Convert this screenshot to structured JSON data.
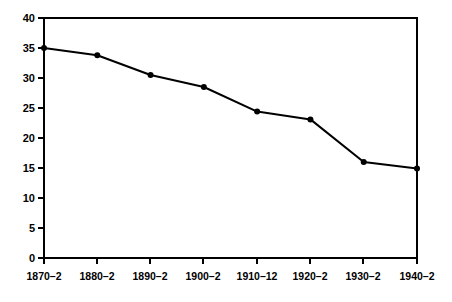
{
  "chart_data": {
    "type": "line",
    "title": "",
    "subtitle": "",
    "xlabel": "",
    "ylabel": "",
    "categories": [
      "1870–2",
      "1880–2",
      "1890–2",
      "1900–2",
      "1910–12",
      "1920–2",
      "1930–2",
      "1940–2"
    ],
    "values": [
      35.0,
      33.8,
      30.5,
      28.5,
      24.4,
      23.1,
      16.0,
      14.9
    ],
    "series": [
      {
        "name": "series-1",
        "values": [
          35.0,
          33.8,
          30.5,
          28.5,
          24.4,
          23.1,
          16.0,
          14.9
        ]
      }
    ],
    "ylim": [
      0,
      40
    ],
    "yticks": [
      0,
      5,
      10,
      15,
      20,
      25,
      30,
      35,
      40
    ],
    "ytick_labels": [
      "0",
      "5",
      "10",
      "15",
      "20",
      "25",
      "30",
      "35",
      "40"
    ],
    "xtick_labels": [
      "1870–2",
      "1880–2",
      "1890–2",
      "1900–2",
      "1910–12",
      "1920–2",
      "1930–2",
      "1940–2"
    ],
    "grid": false,
    "legend": null,
    "legend_position": "none",
    "marker": "filled-circle",
    "line_color": "#000000",
    "marker_color": "#000000",
    "axis_color": "#000000",
    "background_color": "#ffffff",
    "annotations": []
  },
  "plot": {
    "left_px": 44,
    "right_px": 417,
    "top_px": 18,
    "bottom_px": 258
  }
}
